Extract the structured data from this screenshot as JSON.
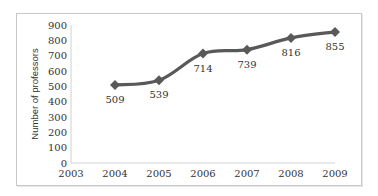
{
  "chart_data": {
    "type": "line",
    "title": "",
    "xlabel": "",
    "ylabel": "Number of professors",
    "x": [
      2004,
      2005,
      2006,
      2007,
      2008,
      2009
    ],
    "values": [
      509,
      539,
      714,
      739,
      816,
      855
    ],
    "series": [
      {
        "name": "Number of professors",
        "values": [
          509,
          539,
          714,
          739,
          816,
          855
        ],
        "color": "#595959",
        "marker": "diamond"
      }
    ],
    "x_ticks": [
      "2003",
      "2004",
      "2005",
      "2006",
      "2007",
      "2008",
      "2009"
    ],
    "y_ticks": [
      "0",
      "100",
      "200",
      "300",
      "400",
      "500",
      "600",
      "700",
      "800",
      "900"
    ],
    "xlim": [
      2003,
      2009
    ],
    "ylim": [
      0,
      900
    ],
    "data_labels": [
      "509",
      "539",
      "714",
      "739",
      "816",
      "855"
    ],
    "grid": false,
    "legend": "none"
  }
}
